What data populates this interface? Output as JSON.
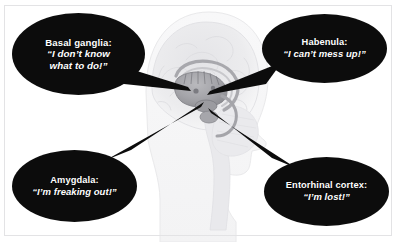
{
  "figure": {
    "type": "annotated-anatomical-diagram",
    "background_color": "#ffffff",
    "frame_color": "#e3e3e5",
    "bubble_color": "#0c0c0c",
    "bubble_text_color": "#ffffff",
    "connector_color": "#0c0c0c"
  },
  "brain": {
    "name": "brain-illustration",
    "description": "faded grayscale mid-sagittal section of a human head and brain",
    "highlight_region": "central limbic / basal ganglia structures",
    "outline_color": "#e8e8ea",
    "cortex_color": "#ebebed",
    "highlight_color": "#9a9a9e"
  },
  "callouts": [
    {
      "id": "basal-ganglia",
      "label": "Basal ganglia:",
      "quote_lines": [
        "“I don’t know",
        "what to do!”"
      ],
      "position": "top-left"
    },
    {
      "id": "habenula",
      "label": "Habenula:",
      "quote_lines": [
        "“I can’t mess up!”"
      ],
      "position": "top-right"
    },
    {
      "id": "amygdala",
      "label": "Amygdala:",
      "quote_lines": [
        "“I’m freaking out!”"
      ],
      "position": "bottom-left"
    },
    {
      "id": "entorhinal-cortex",
      "label": "Entorhinal cortex:",
      "quote_lines": [
        "“I’m lost!”"
      ],
      "position": "bottom-right"
    }
  ]
}
